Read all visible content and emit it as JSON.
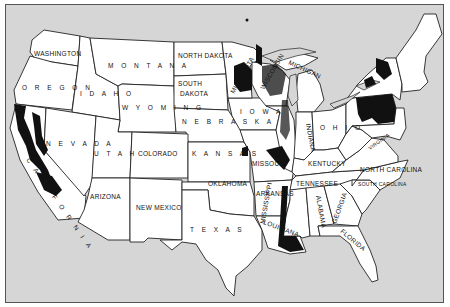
{
  "map": {
    "type": "choropleth-style dot distribution map",
    "region": "Contiguous United States",
    "colors": {
      "ocean": "#d6d6d6",
      "land": "#ffffff",
      "border": "#222222",
      "shaded_area": "#111111"
    },
    "states": {
      "washington": "WASHINGTON",
      "oregon": "O R E G O N",
      "idaho": "I D A H O",
      "montana": "M O N T A N A",
      "wyoming": "W Y O M I N G",
      "north_dakota": "NORTH DAKOTA",
      "south_dakota_1": "SOUTH",
      "south_dakota_2": "DAKOTA",
      "nebraska": "N E B R A S K A",
      "nevada": "N E V A D A",
      "utah": "U T A H",
      "colorado": "COLORADO",
      "kansas": "K A N S A S",
      "california": "C A L I F O R N I A",
      "arizona": "ARIZONA",
      "new_mexico": "NEW MEXICO",
      "oklahoma": "OKLAHOMA",
      "texas": "T E X A S",
      "iowa": "I O W A",
      "missouri": "MISSOURI",
      "arkansas": "ARKANSAS",
      "louisiana": "LOUISIANA",
      "minnesota": "MINNESOTA",
      "wisconsin": "WISCONSIN",
      "michigan": "MICHIGAN",
      "indiana": "INDIANA",
      "ohio": "O H I O",
      "kentucky": "KENTUCKY",
      "tennessee": "TENNESSEE",
      "mississippi": "MISSISSIPPI",
      "alabama": "ALABAMA",
      "georgia": "GEORGIA",
      "florida": "FLORIDA",
      "south_carolina": "SOUTH CAROLINA",
      "north_carolina": "NORTH CAROLINA",
      "virginia": "VIRGINIA",
      "west_virginia": "W. VA.",
      "pennsylvania": "PENNSYLVANIA",
      "new_york": "NEW YORK",
      "maine": "MAINE"
    },
    "shaded_regions": [
      "California central valley and coast",
      "Northern Minnesota",
      "Wisconsin",
      "Illinois / Mississippi river corridor",
      "Missouri (eastern)",
      "Louisiana delta",
      "Pennsylvania",
      "New York (Adirondacks)"
    ]
  }
}
